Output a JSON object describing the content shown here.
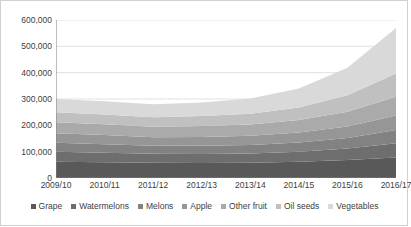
{
  "chart_data": {
    "type": "area",
    "stacked": true,
    "title": "",
    "subtitle": "",
    "xlabel": "",
    "ylabel": "",
    "categories": [
      "2009/10",
      "2010/11",
      "2011/12",
      "2012/13",
      "2013/14",
      "2014/15",
      "2015/16",
      "2016/17"
    ],
    "ylim": [
      0,
      600000
    ],
    "ytick_labels": [
      "0",
      "100,000",
      "200,000",
      "300,000",
      "400,000",
      "500,000",
      "600,000"
    ],
    "ytick_values": [
      0,
      100000,
      200000,
      300000,
      400000,
      500000,
      600000
    ],
    "grid": true,
    "grid_axis": "y",
    "legend_position": "bottom",
    "series": [
      {
        "name": "Grape",
        "color": "#595959",
        "values": [
          62000,
          60000,
          58000,
          57000,
          58000,
          62000,
          68000,
          78000
        ]
      },
      {
        "name": "Watermelons",
        "color": "#6e6e6e",
        "values": [
          38000,
          36000,
          34000,
          34000,
          35000,
          38000,
          44000,
          54000
        ]
      },
      {
        "name": "Melons",
        "color": "#828282",
        "values": [
          34000,
          32000,
          30000,
          31000,
          32000,
          35000,
          40000,
          50000
        ]
      },
      {
        "name": "Apple",
        "color": "#969696",
        "values": [
          36000,
          35000,
          33000,
          34000,
          35000,
          38000,
          44000,
          55000
        ]
      },
      {
        "name": "Other fruit",
        "color": "#aaaaaa",
        "values": [
          42000,
          41000,
          40000,
          41000,
          43000,
          47000,
          56000,
          72000
        ]
      },
      {
        "name": "Oil seeds",
        "color": "#c0c0c0",
        "values": [
          38000,
          37000,
          36000,
          38000,
          41000,
          48000,
          62000,
          88000
        ]
      },
      {
        "name": "Vegetables",
        "color": "#d9d9d9",
        "values": [
          50000,
          50000,
          49000,
          52000,
          58000,
          72000,
          105000,
          173000
        ]
      }
    ],
    "totals": [
      300000,
      291000,
      280000,
      287000,
      302000,
      340000,
      419000,
      570000
    ],
    "axis_line_color": "#808080",
    "grid_line_color": "#d9d9d9",
    "text_color": "#404040"
  }
}
